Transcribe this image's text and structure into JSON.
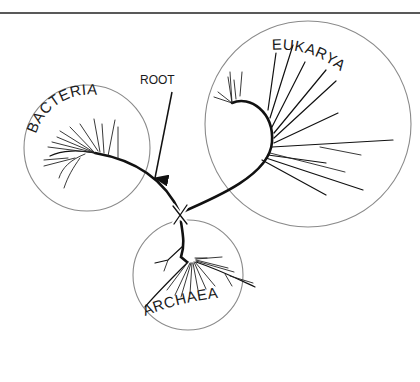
{
  "figure": {
    "type": "phylogenetic-tree",
    "top_rule": true
  },
  "root": {
    "label": "ROOT",
    "marker": "X"
  },
  "domains": [
    {
      "id": "bacteria",
      "label": "BACTERIA"
    },
    {
      "id": "eukarya",
      "label": "EUKARYA"
    },
    {
      "id": "archaea",
      "label": "ARCHAEA"
    }
  ],
  "colors": {
    "line": "#111111",
    "circle": "#8a8a8a",
    "background": "#ffffff"
  }
}
